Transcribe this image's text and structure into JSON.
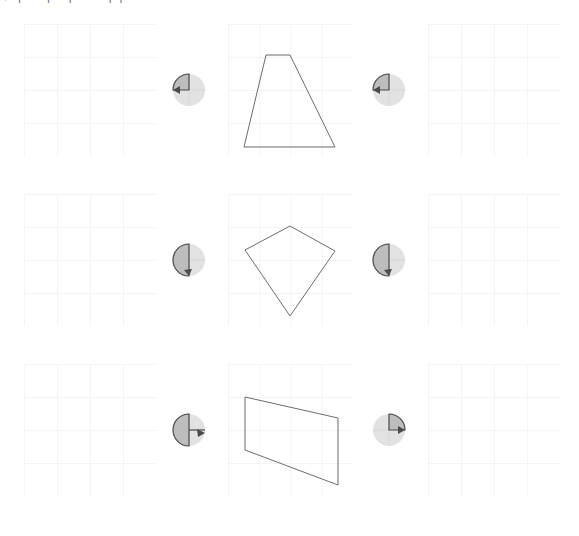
{
  "header": {
    "truncated_text": "¬  ̄  ̄ |  ̄  ̄  ̄  ̄  ̄  ̄  |  ̄  ̄  ̄     ̄  |  ̄  ̄  ̄  ̄  ̄  ̄  ̄   ̄  ̄  |  ̄   |  ̄  ̄"
  },
  "colors": {
    "background": "#ffffff",
    "gridline": "#f4f4f6",
    "shape_stroke": "#6b6b6b",
    "dial_disc": "#e2e2e2",
    "dial_wedge_fill": "#bdbdbd",
    "dial_wedge_stroke": "#4a4a4a"
  },
  "layout": {
    "rows": 3,
    "columns": [
      "empty-grid",
      "rotation-dial",
      "shape-grid",
      "rotation-dial",
      "empty-grid"
    ],
    "grid_cells": 4
  },
  "rows": [
    {
      "id": "row-1",
      "left_panel": {
        "name": "empty-grid-left",
        "shape": null
      },
      "left_dial": {
        "name": "rotation-dial-left",
        "angle_label": "90",
        "wedge_start_deg": 270,
        "wedge_end_deg": 360,
        "direction": "counterclockwise"
      },
      "center_panel": {
        "name": "shape-grid-center",
        "shape_name": "trapezoid",
        "points": "38,31 62,31 107,123 16,123"
      },
      "right_dial": {
        "name": "rotation-dial-right",
        "angle_label": "270",
        "wedge_start_deg": 180,
        "wedge_end_deg": 360,
        "direction": "counterclockwise"
      },
      "right_panel": {
        "name": "empty-grid-right",
        "shape": null
      }
    },
    {
      "id": "row-2",
      "left_panel": {
        "name": "empty-grid-left",
        "shape": null
      },
      "left_dial": {
        "name": "rotation-dial-left",
        "angle_label": "180",
        "wedge_start_deg": 180,
        "wedge_end_deg": 360,
        "direction": "counterclockwise"
      },
      "center_panel": {
        "name": "shape-grid-center",
        "shape_name": "kite",
        "points": "62,32 107,57 62,122 17,56"
      },
      "right_dial": {
        "name": "rotation-dial-right",
        "angle_label": "180",
        "wedge_start_deg": 180,
        "wedge_end_deg": 360,
        "direction": "clockwise"
      },
      "right_panel": {
        "name": "empty-grid-right",
        "shape": null
      }
    },
    {
      "id": "row-3",
      "left_panel": {
        "name": "empty-grid-left",
        "shape": null
      },
      "left_dial": {
        "name": "rotation-dial-left",
        "angle_label": "270",
        "wedge_start_deg": 0,
        "wedge_end_deg": 180,
        "direction": "clockwise"
      },
      "center_panel": {
        "name": "shape-grid-center",
        "shape_name": "quadrilateral",
        "points": "17,33 110,54 110,121 17,86"
      },
      "right_dial": {
        "name": "rotation-dial-right",
        "angle_label": "90",
        "wedge_start_deg": 0,
        "wedge_end_deg": 90,
        "direction": "clockwise"
      },
      "right_panel": {
        "name": "empty-grid-right",
        "shape": null
      }
    }
  ]
}
